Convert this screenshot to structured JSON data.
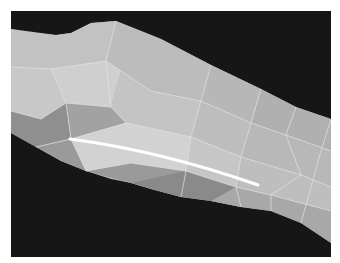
{
  "scene": {
    "description": "3D polygonal mesh render of an elongated surface with a highlighted curve",
    "background_color": "#161616",
    "border_color": "#ffffff",
    "mesh_edge_color": "#e6e6e6",
    "highlight_curve_color": "#ffffff"
  }
}
